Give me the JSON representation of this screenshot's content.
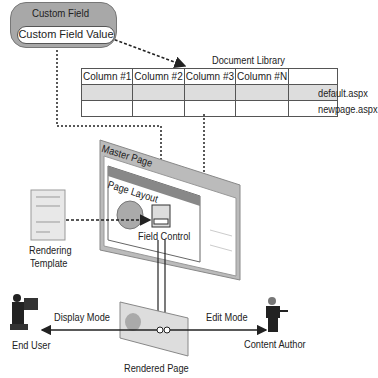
{
  "custom_field": {
    "title": "Custom Field",
    "value": "Custom Field Value"
  },
  "document_library": {
    "title": "Document Library",
    "columns": [
      "Column #1",
      "Column #2",
      "Column #3",
      "Column #N",
      ""
    ],
    "rows": [
      {
        "label": "default.aspx",
        "shaded": true
      },
      {
        "label": "newpage.aspx",
        "shaded": false
      }
    ]
  },
  "master_page": {
    "title": "Master Page"
  },
  "page_layout": {
    "title": "Page Layout"
  },
  "field_control": {
    "label": "Field Control"
  },
  "rendering_template": {
    "label_line1": "Rendering",
    "label_line2": "Template"
  },
  "rendered_page": {
    "label": "Rendered Page"
  },
  "end_user": {
    "label": "End User"
  },
  "content_author": {
    "label": "Content Author"
  },
  "modes": {
    "display": "Display Mode",
    "edit": "Edit Mode"
  },
  "colors": {
    "box_gray": "#a8a8a8",
    "table_shade": "#dddddd",
    "line": "#222222"
  }
}
